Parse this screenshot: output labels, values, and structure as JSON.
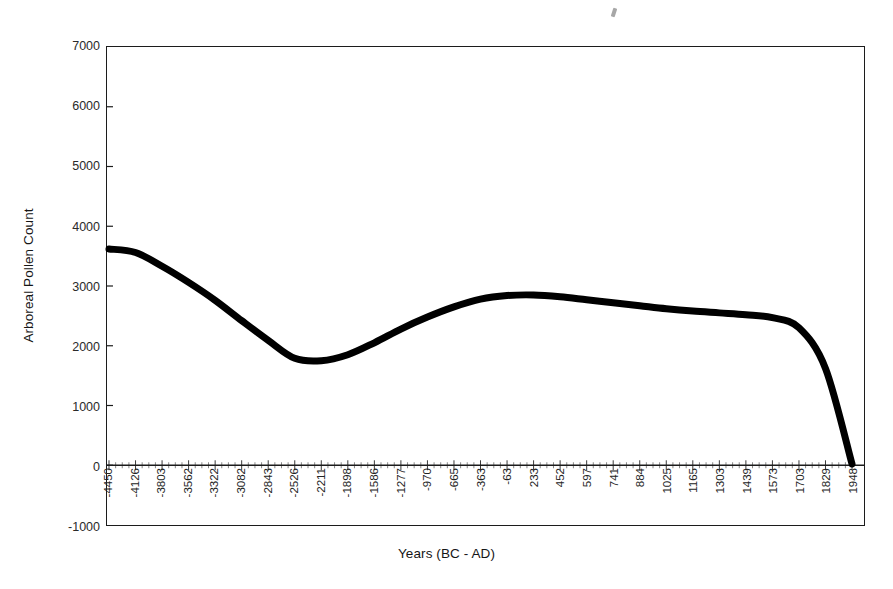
{
  "chart_data": {
    "type": "line",
    "title": "",
    "xlabel": "Years (BC - AD)",
    "ylabel": "Arboreal Pollen Count",
    "ylim": [
      -1000,
      7000
    ],
    "ytick_values": [
      7000,
      6000,
      5000,
      4000,
      3000,
      2000,
      1000,
      0,
      -1000
    ],
    "ytick_labels": [
      "7000",
      "6000",
      "5000",
      "4000",
      "3000",
      "2000",
      "1000",
      "0",
      "-1000"
    ],
    "grid": false,
    "legend": "none",
    "line_color": "#000000",
    "line_width_px": 7,
    "categories": [
      "-4450",
      "-4126",
      "-3803",
      "-3562",
      "-3322",
      "-3082",
      "-2843",
      "-2526",
      "-2211",
      "-1898",
      "-1586",
      "-1277",
      "-970",
      "-665",
      "-363",
      "-63",
      "233",
      "452",
      "597",
      "741",
      "884",
      "1025",
      "1165",
      "1303",
      "1439",
      "1573",
      "1703",
      "1829",
      "1948"
    ],
    "values": [
      3620,
      3560,
      3330,
      3060,
      2760,
      2420,
      2090,
      1790,
      1750,
      1850,
      2050,
      2280,
      2480,
      2650,
      2780,
      2840,
      2850,
      2820,
      2770,
      2720,
      2670,
      2620,
      2580,
      2550,
      2520,
      2470,
      2300,
      1620,
      20
    ],
    "series": [
      {
        "name": "Arboreal Pollen Count",
        "values": [
          3620,
          3560,
          3330,
          3060,
          2760,
          2420,
          2090,
          1790,
          1750,
          1850,
          2050,
          2280,
          2480,
          2650,
          2780,
          2840,
          2850,
          2820,
          2770,
          2720,
          2670,
          2620,
          2580,
          2550,
          2520,
          2470,
          2300,
          1620,
          20
        ]
      }
    ],
    "annotations": {
      "start_value": 3620,
      "minimum_value": 1750,
      "minimum_at": "-2211",
      "local_maximum_value": 2850,
      "local_maximum_at": "233",
      "end_value": 20,
      "end_at": "1948"
    }
  }
}
